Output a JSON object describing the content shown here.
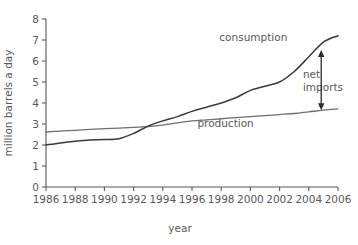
{
  "chart_data": {
    "type": "line",
    "title": "",
    "xlabel": "year",
    "ylabel": "million barrels a day",
    "xlim": [
      1986,
      2006
    ],
    "ylim": [
      0,
      8
    ],
    "grid": false,
    "legend_position": "inline-labels",
    "xticks": [
      "1986",
      "1988",
      "1990",
      "1992",
      "1994",
      "1996",
      "1998",
      "2000",
      "2002",
      "2004",
      "2006"
    ],
    "yticks": [
      "0",
      "1",
      "2",
      "3",
      "4",
      "5",
      "6",
      "7",
      "8"
    ],
    "x": [
      1986,
      1987,
      1988,
      1989,
      1990,
      1991,
      1992,
      1993,
      1994,
      1995,
      1996,
      1997,
      1998,
      1999,
      2000,
      2001,
      2002,
      2003,
      2004,
      2005,
      2006
    ],
    "series": [
      {
        "name": "consumption",
        "color": "#3b3b3d",
        "values": [
          2.0,
          2.1,
          2.18,
          2.24,
          2.26,
          2.3,
          2.55,
          2.9,
          3.15,
          3.35,
          3.6,
          3.8,
          4.0,
          4.25,
          4.6,
          4.8,
          5.0,
          5.5,
          6.2,
          6.9,
          7.2
        ]
      },
      {
        "name": "production",
        "color": "#6e6e70",
        "values": [
          2.62,
          2.66,
          2.7,
          2.74,
          2.78,
          2.8,
          2.84,
          2.88,
          2.95,
          3.05,
          3.15,
          3.2,
          3.25,
          3.3,
          3.35,
          3.4,
          3.45,
          3.5,
          3.58,
          3.66,
          3.72
        ]
      }
    ],
    "annotations": [
      {
        "name": "consumption-label",
        "text": "consumption",
        "x": 2000.2,
        "y": 6.95
      },
      {
        "name": "production-label",
        "text": "production",
        "x": 1998.3,
        "y": 2.88
      },
      {
        "name": "net-imports-label-line1",
        "text": "net",
        "x": 2003.6,
        "y": 5.2
      },
      {
        "name": "net-imports-label-line2",
        "text": "imports",
        "x": 2003.6,
        "y": 4.55
      }
    ],
    "net_imports_arrow": {
      "year": 2004.85,
      "top_value": 6.52,
      "bottom_value": 3.66,
      "double_headed": true
    }
  },
  "colors": {
    "axis": "#58585a",
    "consumption": "#3b3b3d",
    "production": "#6e6e70",
    "annotation": "#2b2b2d",
    "background": "#ffffff"
  }
}
